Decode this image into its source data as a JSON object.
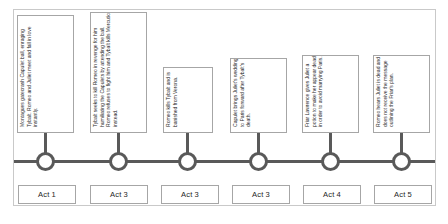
{
  "diagram": {
    "type": "timeline",
    "orientation": "horizontal",
    "title": "",
    "colors": {
      "axis": "#595959",
      "node_stroke": "#595959",
      "box_border": "#a6a6a6",
      "frame_border": "#c9c9c9",
      "text": "#2b2b2b",
      "background": "#ffffff"
    },
    "events": [
      {
        "id": "event-1",
        "description": "Montagues gatecrash Capulet ball, enraging Tybalt. Romeo and Juliet meet and fall in love instantly.",
        "act_label": "Act 1"
      },
      {
        "id": "event-2",
        "description": "Tybalt seeks to kill Romeo in revenge for him humiliating the Capulets by attending the ball. Romeo refuses to fight him and Tybalt kills Mercutio instead.",
        "act_label": "Act 3"
      },
      {
        "id": "event-3",
        "description": "Romeo kills Tybalt and is banished from Verona.",
        "act_label": "Act 3"
      },
      {
        "id": "event-4",
        "description": "Capulet brings Juliet's wedding to Paris forward after Tybalt's death.",
        "act_label": "Act 3"
      },
      {
        "id": "event-5",
        "description": "Friar Lawrence gives Juliet a potion to make her appear dead in order to avoid marrying Paris.",
        "act_label": "Act 4"
      },
      {
        "id": "event-6",
        "description": "Romeo hears Juliet is dead and does not receive the message outlining the Friar's plan.",
        "act_label": "Act 5"
      }
    ]
  }
}
